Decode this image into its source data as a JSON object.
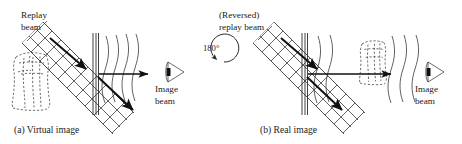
{
  "figure": {
    "type": "optics-holography-diagram",
    "background_color": "#ffffff",
    "ink_color": "#1a1a1a",
    "width": 462,
    "height": 144
  },
  "panel_a": {
    "caption": "(a) Virtual image",
    "replay_label_line1": "Replay",
    "replay_label_line2": "beam",
    "image_label_line1": "Image",
    "image_label_line2": "beam",
    "object_state": "virtual-image-dashed-outline-left-of-plate",
    "eye_icon": "eye-icon"
  },
  "rotation": {
    "angle_label": "180°",
    "icon": "rotation-arrow-icon",
    "direction": "counterclockwise"
  },
  "panel_b": {
    "caption": "(b) Real image",
    "replay_label_line1": "(Reversed)",
    "replay_label_line2": "replay beam",
    "image_label_line1": "Image",
    "image_label_line2": "beam",
    "object_state": "real-image-dashed-outline-right-of-plate",
    "eye_icon": "eye-icon"
  }
}
